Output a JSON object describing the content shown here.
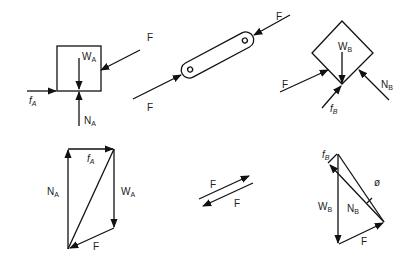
{
  "diagram": {
    "type": "free-body-diagrams-and-force-polygons",
    "panels": [
      {
        "id": "block-a",
        "shape": "square",
        "labels": {
          "friction": "f",
          "friction_sub": "A",
          "weight": "W",
          "weight_sub": "A",
          "normal": "N",
          "normal_sub": "A",
          "force": "F"
        }
      },
      {
        "id": "link",
        "shape": "two-force-member",
        "labels": {
          "force_top": "F",
          "force_bottom": "F"
        }
      },
      {
        "id": "block-b",
        "shape": "diamond",
        "labels": {
          "weight": "W",
          "weight_sub": "B",
          "force": "F",
          "friction": "f",
          "friction_sub": "B",
          "normal": "N",
          "normal_sub": "B"
        }
      },
      {
        "id": "polygon-a",
        "shape": "force-polygon",
        "labels": {
          "normal": "N",
          "normal_sub": "A",
          "friction": "f",
          "friction_sub": "A",
          "weight": "W",
          "weight_sub": "A",
          "force": "F"
        }
      },
      {
        "id": "equal-opposite",
        "shape": "arrow-pair",
        "labels": {
          "top": "F",
          "bottom": "F"
        }
      },
      {
        "id": "polygon-b",
        "shape": "force-polygon",
        "labels": {
          "friction": "f",
          "friction_sub": "B",
          "angle": "ø",
          "weight": "W",
          "weight_sub": "B",
          "normal": "N",
          "normal_sub": "B",
          "force": "F"
        }
      }
    ]
  }
}
